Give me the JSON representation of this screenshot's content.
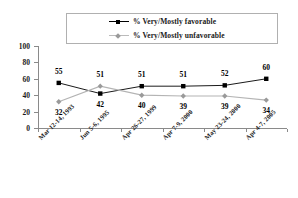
{
  "chart_data": {
    "type": "line",
    "title": "",
    "subtitle": "",
    "xlabel": "",
    "ylabel": "",
    "ylim": [
      0,
      100
    ],
    "yticks": [
      0,
      20,
      40,
      60,
      80,
      100
    ],
    "grid": false,
    "legend_position": "top-center",
    "categories": [
      "Mar 12-14, 1993",
      "Jun 5-6, 1995",
      "Apr 26-27, 1999",
      "Apr 7-9, 2000",
      "May 23-24, 2000",
      "Apr 4-7, 2005"
    ],
    "series": [
      {
        "name": "% Very/Mostly favorable",
        "color": "#000000",
        "marker": "square",
        "values": [
          55,
          42,
          51,
          51,
          52,
          60
        ],
        "label_offsets": [
          "above",
          "below",
          "above",
          "above",
          "above",
          "above"
        ]
      },
      {
        "name": "% Very/Mostly unfavorable",
        "color": "#b4b4b4",
        "marker": "diamond",
        "values": [
          32,
          51,
          40,
          39,
          39,
          34
        ],
        "label_offsets": [
          "below",
          "above",
          "below",
          "below",
          "below",
          "below"
        ]
      }
    ]
  },
  "legend": {
    "items": [
      {
        "label": "% Very/Mostly favorable",
        "key": "fav"
      },
      {
        "label": "% Very/Mostly unfavorable",
        "key": "unfav"
      }
    ]
  },
  "axis": {
    "y_tick_labels": [
      "100",
      "80",
      "60",
      "40",
      "20",
      "0"
    ]
  },
  "colors": {
    "favorable": "#000000",
    "unfavorable": "#b4b4b4",
    "axis": "#8a8a8a",
    "legend_border": "#b0b0b0",
    "text": "#1a1a1a",
    "background": "#ffffff"
  }
}
